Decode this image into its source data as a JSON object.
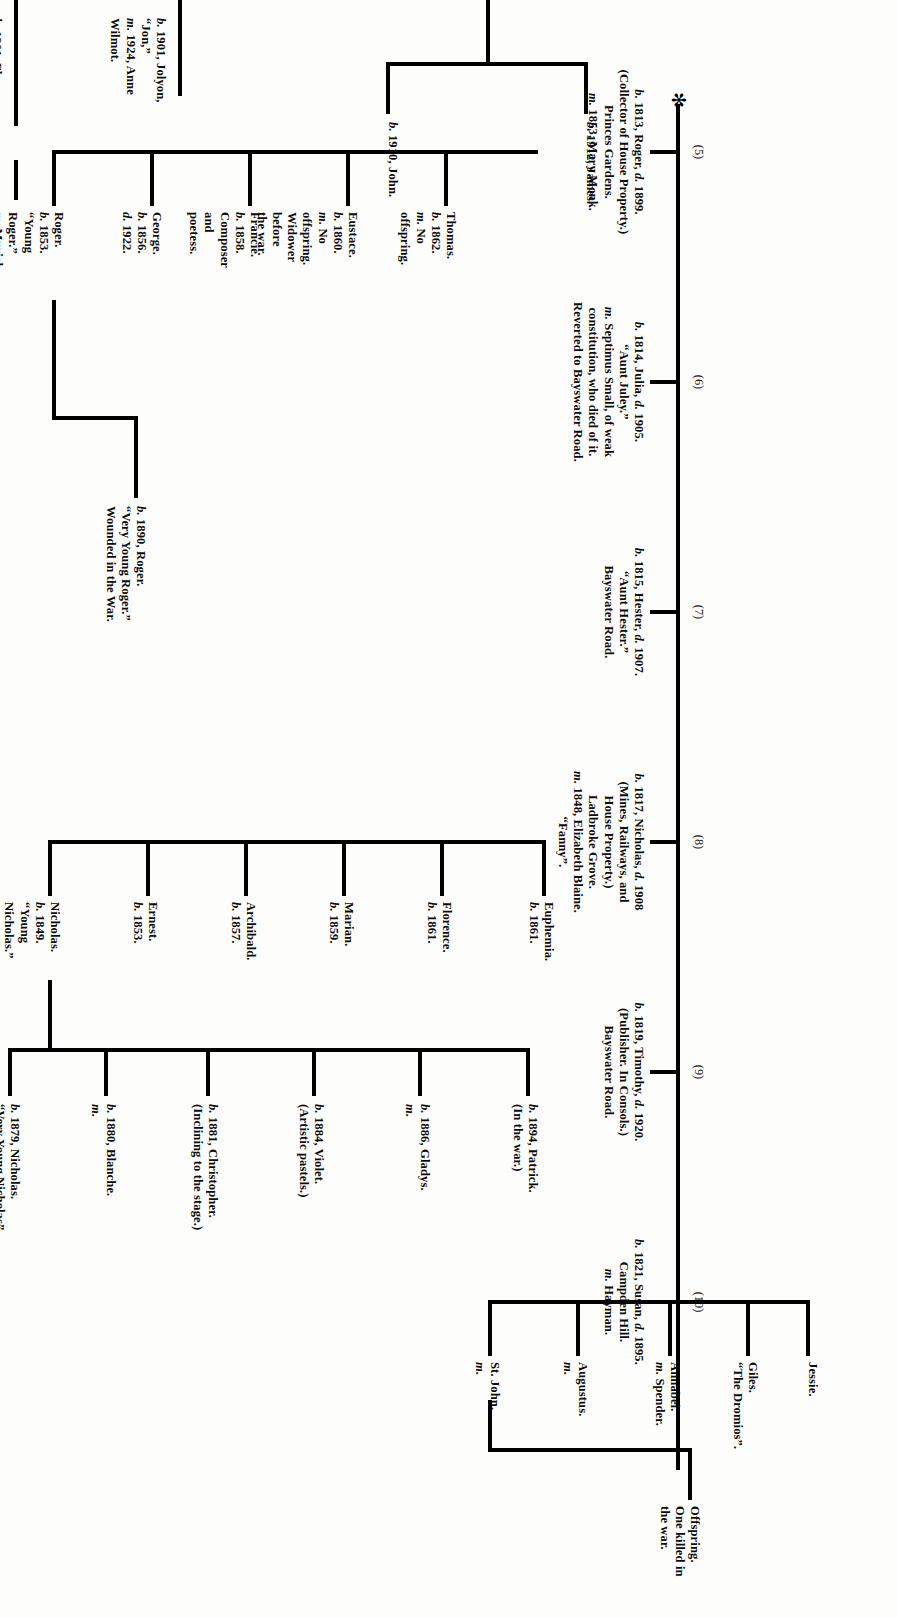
{
  "chart_title": "Forsyte family tree (genealogical chart)",
  "page_marker": "✻",
  "generation_labels": [
    "(5)",
    "(6)",
    "(7)",
    "(8)",
    "(9)",
    "(10)"
  ],
  "trunk": {
    "gen5": {
      "label": "(5)",
      "lines": [
        "b. 1813, Roger, d. 1899.",
        "(Collector of House Property.)",
        "Princes Gardens.",
        "m. 1853, Mary Monk."
      ]
    },
    "gen6": {
      "label": "(6)",
      "lines": [
        "b. 1814, Julia, d. 1905.",
        "“Aunt Juley.”",
        "m. Septimus Small, of weak",
        "constitution, who died of it.",
        "Reverted to Bayswater Road."
      ]
    },
    "gen7": {
      "label": "(7)",
      "lines": [
        "b. 1815, Hester, d. 1907.",
        "“Aunt Hester.”",
        "Bayswater Road."
      ]
    },
    "gen8": {
      "label": "(8)",
      "lines": [
        "b. 1817, Nicholas, d. 1908",
        "(Mines, Railways, and",
        "House Property.)",
        "Ladbroke Grove.",
        "m. 1848, Elizabeth Blaine.",
        "“Fanny”."
      ]
    },
    "gen9": {
      "label": "(9)",
      "lines": [
        "b. 1819, Timothy, d. 1920.",
        "(Publisher. In Consols.)",
        "Bayswater Road."
      ]
    },
    "gen10": {
      "label": "(10)",
      "lines": [
        "b. 1821, Susan, d. 1895.",
        "Campden Hill.",
        "m. Hayman."
      ]
    }
  },
  "roger_children": [
    {
      "name": "roger-young",
      "lines": [
        "Roger.",
        "b. 1853.",
        "“Young",
        "Roger.”",
        "m. Muriel",
        "Wake."
      ]
    },
    {
      "name": "george",
      "lines": [
        "George.",
        "b. 1856.",
        "d. 1922."
      ]
    },
    {
      "name": "francie",
      "lines": [
        "Francie.",
        "b. 1858.",
        "Composer",
        "and",
        "poetess."
      ]
    },
    {
      "name": "eustace",
      "lines": [
        "Eustace.",
        "b. 1860.",
        "m. No",
        "offspring.",
        "Widower",
        "before",
        "the war."
      ]
    },
    {
      "name": "thomas",
      "lines": [
        "Thomas.",
        "b. 1862.",
        "m. No",
        "offspring."
      ]
    }
  ],
  "nicholas_children": [
    {
      "name": "nicholas-young",
      "lines": [
        "Nicholas.",
        "b. 1849.",
        "“Young",
        "Nicholas.”",
        "(Insurances)",
        "m. 1877,",
        "Dorothy",
        "Boxton."
      ]
    },
    {
      "name": "ernest",
      "lines": [
        "Ernest.",
        "b. 1853."
      ]
    },
    {
      "name": "archibald",
      "lines": [
        "Archibald.",
        "b. 1857."
      ]
    },
    {
      "name": "marian",
      "lines": [
        "Marian.",
        "b. 1859."
      ]
    },
    {
      "name": "florence",
      "lines": [
        "Florence.",
        "b. 1861."
      ]
    },
    {
      "name": "euphemia",
      "lines": [
        "Euphemia.",
        "b. 1861."
      ]
    }
  ],
  "susan_children": [
    {
      "name": "st-john",
      "lines": [
        "St. John.",
        "m."
      ]
    },
    {
      "name": "augustus",
      "lines": [
        "Augustus.",
        "m."
      ]
    },
    {
      "name": "annabel",
      "lines": [
        "Annabel.",
        "m. Spender."
      ]
    },
    {
      "name": "giles",
      "lines": [
        "Giles.",
        "“The Dromios”."
      ]
    },
    {
      "name": "jessie",
      "lines": [
        "Jessie."
      ]
    }
  ],
  "susan_offspring": {
    "lines": [
      "Offspring.",
      "One killed in",
      "the war."
    ]
  },
  "young_roger_child": {
    "lines": [
      "b. 1890, Roger.",
      "“Very Young Roger.”",
      "Wounded in the War."
    ]
  },
  "young_nicholas_children": [
    {
      "name": "nicholas-very-young",
      "lines": [
        "b. 1879, Nicholas.",
        "“Very Young Nicholas”",
        "(Barrister, O.B.E.) m."
      ]
    },
    {
      "name": "blanche",
      "lines": [
        "b. 1880, Blanche.",
        "m."
      ]
    },
    {
      "name": "christopher",
      "lines": [
        "b. 1881, Christopher.",
        "(Inclining to the stage.)"
      ]
    },
    {
      "name": "violet",
      "lines": [
        "b. 1884, Violet.",
        "(Artistic pastels.)"
      ]
    },
    {
      "name": "gladys",
      "lines": [
        "b. 1886, Gladys.",
        "m."
      ]
    },
    {
      "name": "patrick",
      "lines": [
        "b. 1894, Patrick.",
        "(In the war.)"
      ]
    }
  ],
  "top_branch": {
    "jolyon": {
      "lines": [
        "b. 1901, Jolyon,",
        "“Jon,”",
        "m. 1924, Anne",
        "Wilmot."
      ]
    },
    "fleur": {
      "lines": [
        "b. 1901, Fleur.",
        "m. 1920, Michael Mont."
      ]
    },
    "kit": {
      "lines": [
        "b. 1923, Christopher.",
        "(Kit.)"
      ]
    },
    "john": {
      "lines": [
        "b. 1910, John."
      ]
    },
    "james": {
      "lines": [
        "b. 1912, James."
      ]
    }
  }
}
